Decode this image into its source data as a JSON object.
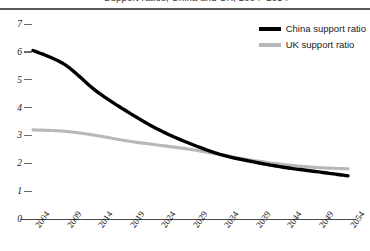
{
  "title_partial": "Support ratios, China and UK, 2004–2054",
  "legend": {
    "position": "top-right",
    "entries": [
      {
        "label": "China support ratio",
        "color": "#000000"
      },
      {
        "label": "UK support ratio",
        "color": "#b8b8b8"
      }
    ]
  },
  "axis": {
    "y_ticks": [
      "7",
      "6",
      "5",
      "4",
      "3",
      "2",
      "1",
      "0"
    ],
    "x_ticks": [
      "2004",
      "2009",
      "2014",
      "2019",
      "2024",
      "2029",
      "2034",
      "2039",
      "2044",
      "2049",
      "2054"
    ]
  },
  "chart_data": {
    "type": "line",
    "title": "Support ratios, China and UK, 2004–2054",
    "xlabel": "",
    "ylabel": "",
    "xlim": [
      2004,
      2054
    ],
    "ylim": [
      0,
      7
    ],
    "grid": false,
    "legend_position": "top-right",
    "x": [
      2004,
      2009,
      2014,
      2019,
      2024,
      2029,
      2034,
      2039,
      2044,
      2049,
      2054
    ],
    "series": [
      {
        "name": "China support ratio",
        "color": "#000000",
        "values": [
          6.05,
          5.55,
          4.6,
          3.85,
          3.2,
          2.7,
          2.3,
          2.05,
          1.85,
          1.7,
          1.55
        ]
      },
      {
        "name": "UK support ratio",
        "color": "#b8b8b8",
        "values": [
          3.2,
          3.15,
          3.0,
          2.8,
          2.65,
          2.5,
          2.3,
          2.1,
          1.95,
          1.85,
          1.8
        ]
      }
    ],
    "annotations": [
      "China declines steeply from about 6.0 in 2004 to about 1.55 in 2054",
      "UK declines gradually from about 3.2 in 2004 to about 1.8 in 2054",
      "The two series cross at about 2040 near a value of 2.0"
    ]
  }
}
